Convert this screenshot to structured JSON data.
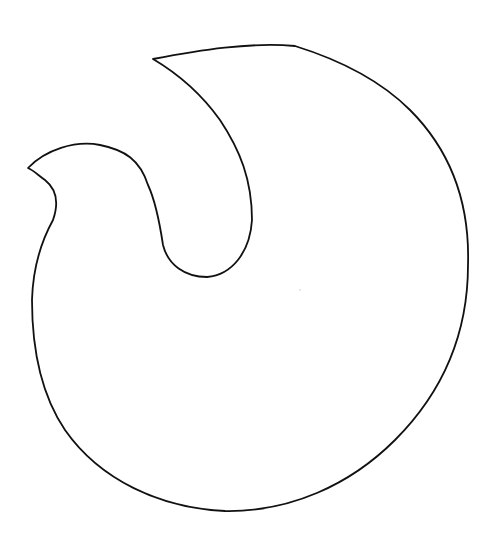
{
  "drawing": {
    "kind": "line-art outline",
    "subject": "abstract flame / dove-like rounded shape",
    "stroke_color": "#111111",
    "background_color": "#ffffff",
    "stroke_width": 1.8,
    "path": "M 153 59 C 200 50, 250 42, 295 46 C 340 60, 380 80, 410 110 C 450 150, 470 200, 468 265 C 468 330, 445 390, 395 440 C 350 485, 290 512, 225 511 C 160 508, 100 480, 65 430 C 38 390, 32 340, 32 300 C 33 265, 42 240, 53 220 C 60 200, 55 188, 45 180 C 38 175, 33 170, 28 168 C 45 150, 75 140, 100 145 C 125 150, 140 160, 148 185 C 155 200, 160 225, 163 245 C 168 265, 185 277, 207 277 C 232 275, 250 252, 252 220 C 252 180, 240 150, 220 120 C 200 92, 175 72, 153 59 Z",
    "stray_mark": {
      "x": 300,
      "y": 290
    }
  }
}
